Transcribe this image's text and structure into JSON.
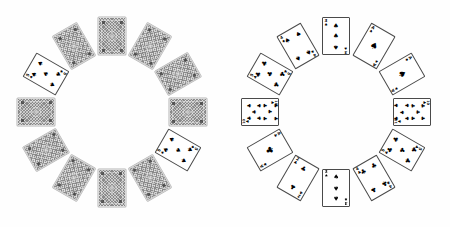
{
  "scene": {
    "title": "Two circular arrangements of playing cards",
    "background_color": "#ffffff",
    "card_back_color": "#8d8d8d",
    "pip_color": "#000000",
    "suit_glyphs": {
      "spade": "♠",
      "club": "♣",
      "heart": "♥",
      "diamond": "♦"
    }
  },
  "groups": [
    {
      "id": "left-circle",
      "label": "Left card circle",
      "center_x": 112,
      "center_y": 112,
      "radius": 76,
      "card_count": 12,
      "cards": [
        {
          "index": 0,
          "angle": 0,
          "facing": "down",
          "rank": "",
          "suit": "",
          "w": 28,
          "h": 38
        },
        {
          "index": 1,
          "angle": 30,
          "facing": "down",
          "rank": "",
          "suit": "",
          "w": 28,
          "h": 38
        },
        {
          "index": 2,
          "angle": 60,
          "facing": "down",
          "rank": "",
          "suit": "",
          "w": 28,
          "h": 38
        },
        {
          "index": 3,
          "angle": 90,
          "facing": "down",
          "rank": "",
          "suit": "",
          "w": 28,
          "h": 38
        },
        {
          "index": 4,
          "angle": 120,
          "facing": "up",
          "rank": "5",
          "suit": "spade",
          "w": 28,
          "h": 38
        },
        {
          "index": 5,
          "angle": 150,
          "facing": "down",
          "rank": "",
          "suit": "",
          "w": 28,
          "h": 38
        },
        {
          "index": 6,
          "angle": 180,
          "facing": "down",
          "rank": "",
          "suit": "",
          "w": 28,
          "h": 38
        },
        {
          "index": 7,
          "angle": 210,
          "facing": "down",
          "rank": "",
          "suit": "",
          "w": 28,
          "h": 38
        },
        {
          "index": 8,
          "angle": 240,
          "facing": "down",
          "rank": "",
          "suit": "",
          "w": 28,
          "h": 38
        },
        {
          "index": 9,
          "angle": 270,
          "facing": "down",
          "rank": "",
          "suit": "",
          "w": 28,
          "h": 38
        },
        {
          "index": 10,
          "angle": 300,
          "facing": "up",
          "rank": "5",
          "suit": "spade",
          "w": 28,
          "h": 38
        },
        {
          "index": 11,
          "angle": 330,
          "facing": "down",
          "rank": "",
          "suit": "",
          "w": 28,
          "h": 38
        }
      ]
    },
    {
      "id": "right-circle",
      "label": "Right card circle",
      "center_x": 336,
      "center_y": 112,
      "radius": 76,
      "card_count": 12,
      "cards": [
        {
          "index": 0,
          "angle": 0,
          "facing": "up",
          "rank": "3",
          "suit": "spade",
          "w": 28,
          "h": 38
        },
        {
          "index": 1,
          "angle": 30,
          "facing": "up",
          "rank": "A",
          "suit": "spade",
          "w": 28,
          "h": 38
        },
        {
          "index": 2,
          "angle": 60,
          "facing": "up",
          "rank": "A",
          "suit": "spade",
          "w": 28,
          "h": 38
        },
        {
          "index": 3,
          "angle": 90,
          "facing": "up",
          "rank": "10",
          "suit": "club",
          "w": 28,
          "h": 38
        },
        {
          "index": 4,
          "angle": 120,
          "facing": "up",
          "rank": "5",
          "suit": "club",
          "w": 28,
          "h": 38
        },
        {
          "index": 5,
          "angle": 150,
          "facing": "up",
          "rank": "4",
          "suit": "club",
          "w": 28,
          "h": 38
        },
        {
          "index": 6,
          "angle": 180,
          "facing": "up",
          "rank": "3",
          "suit": "spade",
          "w": 28,
          "h": 38
        },
        {
          "index": 7,
          "angle": 210,
          "facing": "up",
          "rank": "2",
          "suit": "club",
          "w": 28,
          "h": 38
        },
        {
          "index": 8,
          "angle": 240,
          "facing": "up",
          "rank": "A",
          "suit": "club",
          "w": 28,
          "h": 38
        },
        {
          "index": 9,
          "angle": 270,
          "facing": "up",
          "rank": "10",
          "suit": "club",
          "w": 28,
          "h": 38
        },
        {
          "index": 10,
          "angle": 300,
          "facing": "up",
          "rank": "5",
          "suit": "club",
          "w": 28,
          "h": 38
        },
        {
          "index": 11,
          "angle": 330,
          "facing": "up",
          "rank": "4",
          "suit": "spade",
          "w": 28,
          "h": 38
        }
      ]
    }
  ]
}
